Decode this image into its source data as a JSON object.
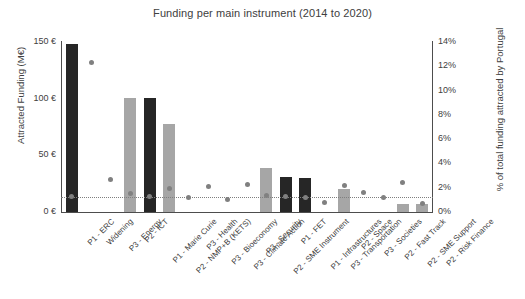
{
  "chart_data": {
    "type": "bar",
    "title": "Funding per main instrument (2014 to 2020)",
    "xlabel": "",
    "ylabel": "Attracted Funding (M€)",
    "y2label": "% of total funding attracted by Portugal",
    "ylim": [
      0,
      150
    ],
    "y2lim": [
      0,
      14
    ],
    "grid": false,
    "legend": "none",
    "y_ticks": [
      "0 €",
      "50 €",
      "100 €",
      "150 €"
    ],
    "y_tick_values": [
      0,
      50,
      100,
      150
    ],
    "y2_ticks": [
      "0%",
      "2%",
      "4%",
      "6%",
      "8%",
      "10%",
      "12%",
      "14%"
    ],
    "y2_tick_values": [
      0,
      2,
      4,
      6,
      8,
      10,
      12,
      14
    ],
    "categories": [
      "P1 - ERC",
      "Widening",
      "P3 - Energy",
      "P2 - ICT",
      "P1 - Marie Curie",
      "P2 - NMP+B (KETS)",
      "P3 - Health",
      "P3 - Bioeconomy",
      "P3 - Climate Action",
      "P3 - Security",
      "P2 - SME Instrument",
      "P1 - FET",
      "P1 - Infrastructures",
      "P3 - Transportation",
      "P2 - Space",
      "P3 - Societies",
      "P2 - Fast Track",
      "P2 - SME Support",
      "P2 - Risk Finance"
    ],
    "series": [
      {
        "name": "Attracted Funding (M€)",
        "axis": "left",
        "type": "bar",
        "values": [
          148,
          0,
          0,
          101,
          101,
          78,
          0,
          0,
          0,
          0,
          39,
          31,
          30,
          0,
          20,
          0,
          0,
          7,
          7
        ],
        "colors": [
          "dark",
          "none",
          "none",
          "light",
          "dark",
          "light",
          "none",
          "none",
          "none",
          "none",
          "light",
          "dark",
          "dark",
          "none",
          "light",
          "none",
          "none",
          "light",
          "light"
        ]
      },
      {
        "name": "% of total funding attracted by Portugal",
        "axis": "right",
        "type": "scatter",
        "values": [
          1.3,
          12.3,
          2.7,
          1.5,
          1.3,
          1.9,
          1.2,
          2.1,
          1.0,
          2.3,
          1.4,
          1.3,
          1.2,
          0.8,
          2.2,
          1.6,
          1.2,
          2.4,
          0.7
        ]
      }
    ],
    "reference_line": {
      "value": 1.2,
      "axis": "right",
      "style": "dotted"
    },
    "colors": {
      "bar_dark": "#262626",
      "bar_light": "#a6a6a6",
      "dot": "#808080",
      "axis": "#4d4d4d",
      "text": "#404040"
    }
  }
}
